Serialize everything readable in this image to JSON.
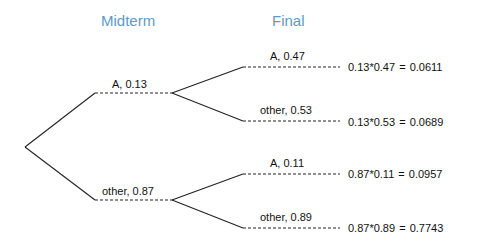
{
  "headers": {
    "first": "Midterm",
    "second": "Final"
  },
  "colors": {
    "header": "#5b9bc8",
    "line": "#222222"
  },
  "midterm": [
    {
      "label": "A,  0.13"
    },
    {
      "label": "other,  0.87"
    }
  ],
  "final": [
    {
      "label": "A,  0.47",
      "result": "0.13*0.47  =  0.0611"
    },
    {
      "label": "other,  0.53",
      "result": "0.13*0.53  =  0.0689"
    },
    {
      "label": "A,  0.11",
      "result": "0.87*0.11  =  0.0957"
    },
    {
      "label": "other,  0.89",
      "result": "0.87*0.89  =  0.7743"
    }
  ]
}
